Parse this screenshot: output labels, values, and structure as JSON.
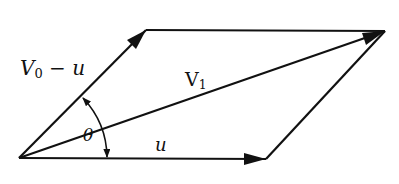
{
  "diagram": {
    "type": "vector-parallelogram",
    "colors": {
      "stroke": "#111111",
      "background": "#ffffff"
    },
    "points": {
      "origin": [
        19,
        158
      ],
      "top_left": [
        146,
        30
      ],
      "top_right": [
        385,
        31
      ],
      "bottom_right": [
        266,
        159
      ]
    },
    "labels": {
      "v0_minus_u": {
        "main": "V",
        "sub": "0",
        "rest": " − u"
      },
      "v1": {
        "main": "V",
        "sub": "1"
      },
      "theta": "θ",
      "u": "u"
    },
    "vectors": [
      {
        "name": "V0 - u",
        "from": "origin",
        "to": "top_left"
      },
      {
        "name": "u",
        "from": "origin",
        "to": "bottom_right"
      },
      {
        "name": "V1",
        "from": "origin",
        "to": "top_right"
      }
    ],
    "angle": {
      "symbol": "θ",
      "between": [
        "u",
        "V0 - u"
      ],
      "double_arrow": true
    }
  }
}
